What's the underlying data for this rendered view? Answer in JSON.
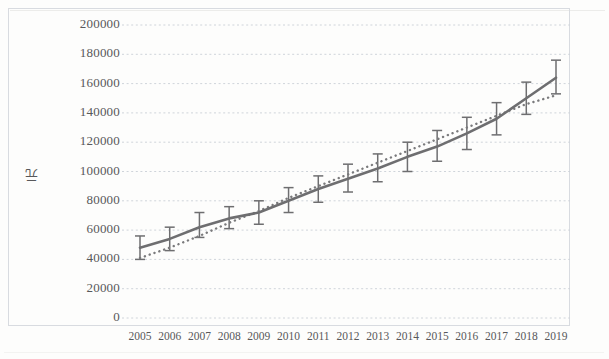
{
  "chart_data": {
    "type": "line",
    "title": "",
    "xlabel": "",
    "ylabel": "元",
    "ylim": [
      0,
      200000
    ],
    "ytick_step": 20000,
    "grid": true,
    "legend": "none",
    "categories": [
      "2005",
      "2006",
      "2007",
      "2008",
      "2009",
      "2010",
      "2011",
      "2012",
      "2013",
      "2014",
      "2015",
      "2016",
      "2017",
      "2018",
      "2019"
    ],
    "yticks": [
      "200000",
      "180000",
      "160000",
      "140000",
      "120000",
      "100000",
      "80000",
      "60000",
      "40000",
      "20000",
      "0"
    ],
    "series": [
      {
        "name": "solid-line-with-error-bars",
        "style": "solid",
        "values": [
          48000,
          54000,
          62000,
          68000,
          72000,
          80000,
          88000,
          95000,
          102000,
          110000,
          117000,
          126000,
          136000,
          150000,
          164000
        ],
        "error_upper": [
          56000,
          62000,
          72000,
          76000,
          80000,
          89000,
          97000,
          105000,
          112000,
          120000,
          128000,
          137000,
          147000,
          161000,
          176000
        ],
        "error_lower": [
          40000,
          46000,
          55000,
          61000,
          64000,
          72000,
          79000,
          86000,
          93000,
          100000,
          107000,
          115000,
          125000,
          139000,
          153000
        ]
      },
      {
        "name": "dotted-line",
        "style": "dotted",
        "values": [
          41000,
          48000,
          56000,
          65000,
          73000,
          82000,
          90000,
          98000,
          106000,
          114000,
          122000,
          130000,
          138000,
          146000,
          152000
        ]
      }
    ],
    "colors": {
      "solid": "#6e6e70",
      "dotted": "#7a7a7c",
      "grid": "#cfd4da",
      "text": "#58585a",
      "frame": "#d8dbe0"
    }
  }
}
